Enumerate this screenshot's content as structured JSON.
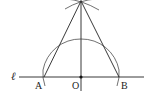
{
  "diagram": {
    "type": "geometric-construction",
    "line_label": "ℓ",
    "points": [
      {
        "id": "A",
        "label": "A"
      },
      {
        "id": "O",
        "label": "O"
      },
      {
        "id": "B",
        "label": "B"
      }
    ],
    "colors": {
      "stroke": "#222222",
      "background": "#ffffff"
    }
  }
}
